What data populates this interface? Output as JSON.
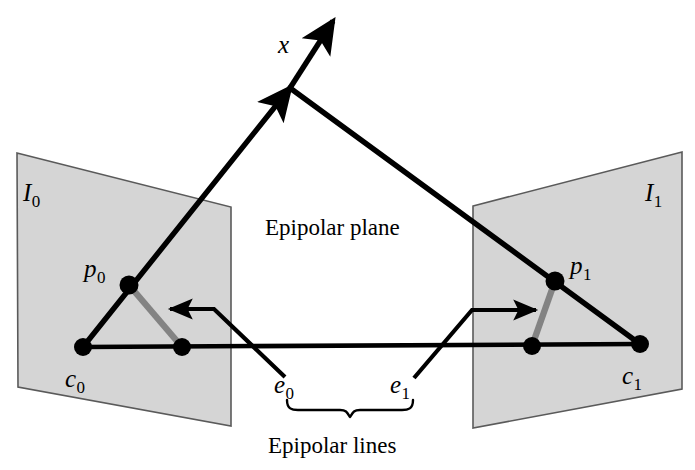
{
  "figure": {
    "type": "epipolar-geometry-diagram",
    "width": 695,
    "height": 470,
    "background_color": "#ffffff",
    "plane_fill_color": "#d4d4d4",
    "plane_stroke_color": "#555555",
    "line_color": "#000000",
    "highlight_segment_color": "#808080"
  },
  "labels": {
    "image_plane_left": {
      "base": "I",
      "sub": "0"
    },
    "image_plane_right": {
      "base": "I",
      "sub": "1"
    },
    "projection_left": {
      "base": "p",
      "sub": "0"
    },
    "projection_right": {
      "base": "p",
      "sub": "1"
    },
    "camera_center_left": {
      "base": "c",
      "sub": "0"
    },
    "camera_center_right": {
      "base": "c",
      "sub": "1"
    },
    "epipole_left": {
      "base": "e",
      "sub": "0"
    },
    "epipole_right": {
      "base": "e",
      "sub": "1"
    },
    "scene_point": {
      "base": "x",
      "sub": ""
    },
    "epipolar_plane": "Epipolar plane",
    "epipolar_lines": "Epipolar lines"
  },
  "geometry": {
    "left_plane_quad": [
      [
        17,
        153
      ],
      [
        231,
        207
      ],
      [
        231,
        426
      ],
      [
        18,
        387
      ]
    ],
    "right_plane_quad": [
      [
        473,
        206
      ],
      [
        682,
        152
      ],
      [
        682,
        389
      ],
      [
        473,
        428
      ]
    ],
    "scene_point_vertex": [
      290,
      88
    ],
    "arrow_tip": [
      337,
      17
    ],
    "baseline": [
      [
        83,
        347
      ],
      [
        640,
        344
      ]
    ],
    "p0_dot": [
      129,
      285
    ],
    "p1_dot": [
      555,
      281
    ],
    "c0_dot": [
      83,
      347
    ],
    "c1_dot": [
      640,
      344
    ],
    "e0_dot": [
      182,
      347
    ],
    "e1_dot": [
      532,
      346
    ],
    "gray_segment_left": [
      [
        129,
        285
      ],
      [
        182,
        347
      ]
    ],
    "gray_segment_right": [
      [
        555,
        281
      ],
      [
        532,
        346
      ]
    ],
    "pointer_left": [
      [
        283,
        375
      ],
      [
        213,
        309
      ],
      [
        165,
        309
      ]
    ],
    "pointer_right": [
      [
        416,
        377
      ],
      [
        473,
        310
      ],
      [
        540,
        310
      ]
    ],
    "brace_span": [
      285,
      415
    ],
    "brace_y": 404
  }
}
